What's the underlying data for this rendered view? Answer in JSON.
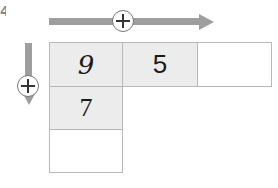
{
  "corner_fragment": "4",
  "operation": {
    "horizontal_operator": "plus",
    "vertical_operator": "plus",
    "arrow_color": "#9e9e9e"
  },
  "grid": {
    "row1": [
      "9",
      "5",
      ""
    ],
    "col1": [
      "9",
      "7",
      ""
    ],
    "cells": {
      "r1c1": "9",
      "r1c2": "5",
      "r1c3": "",
      "r2c1": "7",
      "r3c1": ""
    },
    "shaded_color": "#ececec",
    "border_color": "#b8b8b8"
  }
}
